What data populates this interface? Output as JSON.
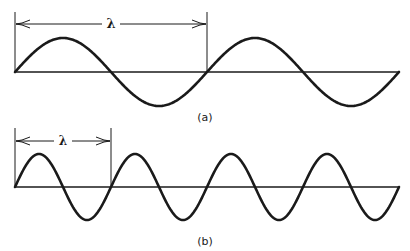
{
  "figure": {
    "stroke_color": "#1a1a1a",
    "background": "#ffffff",
    "panels": [
      {
        "id": "a",
        "caption": "(a)",
        "wavelength_symbol": "λ",
        "wavelength_px": 192,
        "cycles_shown": 2,
        "amplitude_px": 34,
        "axis": {
          "x_start": 15,
          "x_end": 399,
          "y": 72
        },
        "bracket": {
          "x_left": 15,
          "x_right": 207,
          "y_top": 12,
          "arrow_y": 24
        },
        "caption_pos": {
          "x": 205,
          "y": 121
        }
      },
      {
        "id": "b",
        "caption": "(b)",
        "wavelength_symbol": "λ",
        "wavelength_px": 96,
        "cycles_shown": 4,
        "amplitude_px": 33,
        "axis": {
          "x_start": 15,
          "x_end": 399,
          "y": 187
        },
        "bracket": {
          "x_left": 15,
          "x_right": 111,
          "y_top": 128,
          "arrow_y": 141
        },
        "caption_pos": {
          "x": 205,
          "y": 245
        }
      }
    ]
  }
}
